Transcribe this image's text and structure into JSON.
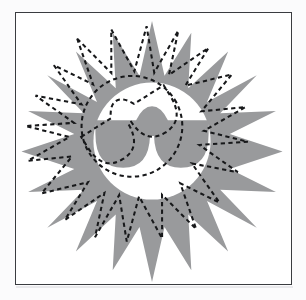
{
  "document": {
    "title": "Sun with Sunglasses Clipart",
    "canvas_width": 306,
    "canvas_height": 300,
    "background_color": "#fbfbfc"
  },
  "artboard": {
    "name": "image-frame",
    "x": 15,
    "y": 12,
    "width": 277,
    "height": 273,
    "border_color": "#3a3c40",
    "border_width": 1.5,
    "fill_color": "#ffffff"
  },
  "graphic": {
    "description": "Gray star-burst sun with a white circular face wearing gray sunglasses, overlaid by a dashed black selection outline of the same shape rotated and offset",
    "colors": {
      "sun_fill": "#999a9c",
      "face_fill": "#ffffff",
      "glasses_fill": "#999a9c",
      "selection_stroke": "#17181a",
      "page_background": "#ffffff"
    },
    "sun": {
      "name": "sun-starburst",
      "center_x": 152,
      "center_y": 144,
      "spike_count": 16,
      "outer_radius": 131,
      "inner_radius": 70,
      "rotation_deg": -4
    },
    "face": {
      "name": "sun-face-disc",
      "center_x": 152,
      "center_y": 141,
      "radius": 59
    },
    "sunglasses": {
      "name": "sunglasses",
      "bridge_notch": true,
      "lens_count": 2,
      "band_top_y": 120,
      "band_bottom_y": 168
    },
    "selection_outline": {
      "name": "dashed-selection-outline",
      "stroke_color": "#17181a",
      "stroke_width": 2,
      "dash_pattern": "5 4",
      "offset_x": -22,
      "offset_y": -14,
      "rotation_deg": -32,
      "scale": 0.86
    }
  }
}
